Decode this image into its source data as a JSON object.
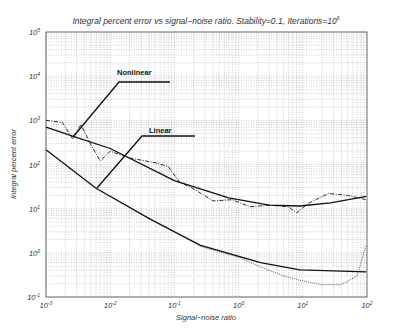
{
  "chart_data": {
    "type": "line",
    "title": "Integral percent error vs signal−noise ratio. Stability=0.1, Iterations=10",
    "title_sup": "6",
    "xlabel": "Signal−noise ratio",
    "ylabel": "Integral percent error",
    "xscale": "log",
    "yscale": "log",
    "xlim": [
      0.001,
      100
    ],
    "ylim": [
      0.1,
      100000
    ],
    "grid": true,
    "x_ticks": [
      {
        "base": "10",
        "exp": "-3",
        "value": 0.001
      },
      {
        "base": "10",
        "exp": "-2",
        "value": 0.01
      },
      {
        "base": "10",
        "exp": "-1",
        "value": 0.1
      },
      {
        "base": "10",
        "exp": "0",
        "value": 1
      },
      {
        "base": "10",
        "exp": "1",
        "value": 10
      },
      {
        "base": "10",
        "exp": "2",
        "value": 100
      }
    ],
    "y_ticks": [
      {
        "base": "10",
        "exp": "-1",
        "value": 0.1
      },
      {
        "base": "10",
        "exp": "0",
        "value": 1
      },
      {
        "base": "10",
        "exp": "1",
        "value": 10
      },
      {
        "base": "10",
        "exp": "2",
        "value": 100
      },
      {
        "base": "10",
        "exp": "3",
        "value": 1000
      },
      {
        "base": "10",
        "exp": "4",
        "value": 10000
      },
      {
        "base": "10",
        "exp": "5",
        "value": 100000
      }
    ],
    "series": [
      {
        "name": "Nonlinear (theory)",
        "style": "solid",
        "x": [
          0.001,
          0.0026,
          0.01,
          0.1,
          0.7,
          3,
          9,
          27,
          97
        ],
        "y": [
          700,
          440,
          230,
          43,
          17.5,
          12,
          11.5,
          13.5,
          19
        ]
      },
      {
        "name": "Nonlinear (simulated)",
        "style": "dashdot",
        "x": [
          0.001,
          0.0018,
          0.0026,
          0.0035,
          0.005,
          0.007,
          0.01,
          0.02,
          0.05,
          0.08,
          0.12,
          0.2,
          0.4,
          0.8,
          1.5,
          3,
          6,
          8,
          12,
          25,
          50,
          97
        ],
        "y": [
          1000,
          900,
          380,
          800,
          280,
          120,
          200,
          140,
          110,
          90,
          40,
          28,
          15,
          16,
          11,
          12,
          11,
          8,
          13,
          22,
          20,
          16
        ]
      },
      {
        "name": "Linear (theory)",
        "style": "solid",
        "x": [
          0.001,
          0.006,
          0.042,
          0.25,
          2.2,
          9,
          97
        ],
        "y": [
          215,
          29,
          5.8,
          1.5,
          0.6,
          0.41,
          0.37
        ]
      },
      {
        "name": "Linear (simulated)",
        "style": "dotted",
        "x": [
          0.25,
          1,
          2.2,
          5,
          9,
          12,
          20,
          40,
          70,
          97
        ],
        "y": [
          1.4,
          0.8,
          0.48,
          0.3,
          0.24,
          0.22,
          0.19,
          0.19,
          0.3,
          1.5
        ]
      }
    ],
    "annotations": [
      {
        "text": "Nonlinear",
        "label_x_px": 117,
        "label_y_px": 75,
        "line": [
          [
            170,
            82
          ],
          [
            119,
            82
          ],
          [
            73,
            137
          ]
        ]
      },
      {
        "text": "Linear",
        "label_x_px": 149,
        "label_y_px": 133,
        "line": [
          [
            195,
            136
          ],
          [
            142,
            136
          ],
          [
            97,
            188
          ]
        ]
      }
    ],
    "plot_area_px": {
      "left": 46,
      "top": 32,
      "right": 367,
      "bottom": 297
    }
  }
}
